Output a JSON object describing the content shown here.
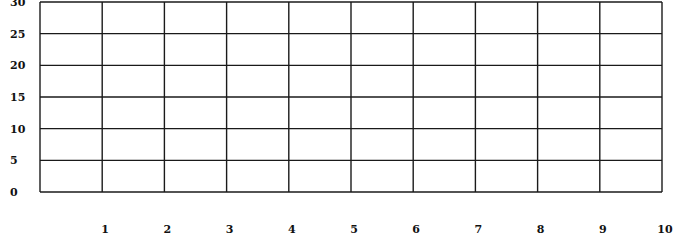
{
  "chart_data": {
    "type": "line",
    "title": "",
    "xlabel": "",
    "ylabel": "",
    "x_ticks": [
      "1",
      "2",
      "3",
      "4",
      "5",
      "6",
      "7",
      "8",
      "9",
      "10"
    ],
    "y_ticks": [
      "0",
      "5",
      "10",
      "15",
      "20",
      "25",
      "30"
    ],
    "xlim": [
      0,
      10
    ],
    "ylim": [
      0,
      30
    ],
    "grid": true,
    "series": [],
    "legend": null
  },
  "colors": {
    "grid": "#1a1a1a",
    "text": "#111111",
    "background": "#ffffff"
  }
}
